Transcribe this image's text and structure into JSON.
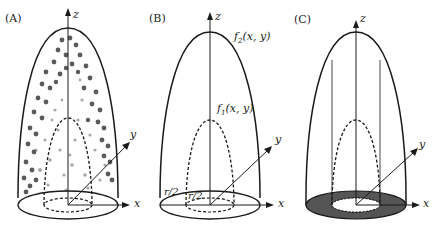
{
  "figure": {
    "panels": [
      {
        "id": "A",
        "label": "(A)",
        "axes": {
          "z": "z",
          "x": "x",
          "y": "y"
        },
        "description": "Outer paraboloid filled with scattered dots, dashed inner paraboloid, base ellipse with inner dashed ellipse"
      },
      {
        "id": "B",
        "label": "(B)",
        "axes": {
          "z": "z",
          "x": "x",
          "y": "y"
        },
        "outer_surface_label": "f",
        "outer_surface_sub": "2",
        "outer_surface_args": "(x, y)",
        "inner_surface_label": "f",
        "inner_surface_sub": "1",
        "inner_surface_args": "(x, y)",
        "radius_outer_label": "r/2",
        "radius_inner_label": "r/2"
      },
      {
        "id": "C",
        "label": "(C)",
        "axes": {
          "z": "z",
          "x": "x",
          "y": "y"
        },
        "description": "Outer paraboloid with vertical guide lines, dashed inner paraboloid, shaded annulus at base"
      }
    ],
    "colors": {
      "stroke": "#1a1a1a",
      "dot_dark": "#5a5a5a",
      "dot_light": "#a8a8a8",
      "annulus_fill": "#555555"
    }
  }
}
